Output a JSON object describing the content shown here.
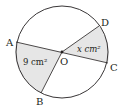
{
  "diagram": {
    "type": "circle-sectors",
    "center": {
      "label": "O",
      "x": 62,
      "y": 52
    },
    "radius": 46,
    "points": {
      "A": {
        "label": "A",
        "x": 16,
        "y": 42
      },
      "B": {
        "label": "B",
        "x": 41,
        "y": 93
      },
      "C": {
        "label": "C",
        "x": 108,
        "y": 63
      },
      "D": {
        "label": "D",
        "x": 99,
        "y": 26
      }
    },
    "sectors": [
      {
        "name": "AOB",
        "area_label": "9 cm²",
        "fill": "#e6e6e6"
      },
      {
        "name": "DOC",
        "area_label": "x cm²",
        "fill": "#e6e6e6"
      }
    ],
    "colors": {
      "stroke": "#231f20",
      "shade": "#e6e6e6"
    }
  }
}
